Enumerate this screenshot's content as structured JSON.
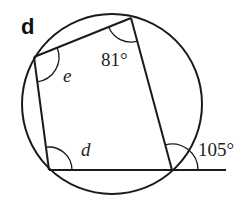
{
  "figure": {
    "panel_label": "d",
    "colors": {
      "stroke": "#1a1a1a",
      "background": "#ffffff"
    },
    "circle": {
      "cx": 112,
      "cy": 104,
      "r": 90
    },
    "vertices": {
      "A": {
        "x": 34,
        "y": 57
      },
      "B": {
        "x": 131,
        "y": 18
      },
      "C": {
        "x": 172,
        "y": 170
      },
      "D": {
        "x": 49,
        "y": 170
      }
    },
    "extension_end": {
      "x": 226,
      "y": 170
    },
    "angles": [
      {
        "label": "e",
        "vertex": "A",
        "kind": "unknown"
      },
      {
        "label": "81°",
        "vertex": "B",
        "kind": "given"
      },
      {
        "label": "d",
        "vertex": "D",
        "kind": "unknown"
      },
      {
        "label": "105°",
        "vertex": "C",
        "kind": "exterior-given"
      }
    ]
  }
}
